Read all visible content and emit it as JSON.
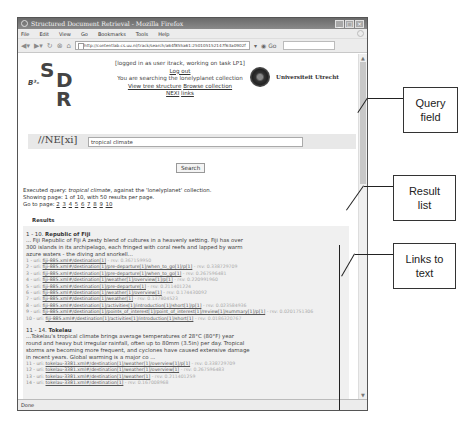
{
  "browser": {
    "window_title": "Structured Document Retrieval - Mozilla Firefox",
    "menu": [
      "File",
      "Edit",
      "View",
      "Go",
      "Bookmarks",
      "Tools",
      "Help"
    ],
    "url": "http://contentlab.cs.uu.nl/track/search/a64f855a61:250105152147f63a0902f",
    "status": "Done"
  },
  "logo": {
    "s": "S",
    "d": "D",
    "r": "R",
    "b": "B³-",
    "nexi": "//NE[xi]"
  },
  "session": {
    "logged_in": "[logged in as user itrack, working on task LP1]",
    "logout": "Log out",
    "collection_note": "You are searching the lonelyplanet collection",
    "view_tree": "View tree structure",
    "browse": "Browse collection",
    "nexi": "NEXI",
    "links": "links"
  },
  "university": {
    "name": "Universiteit Utrecht"
  },
  "search": {
    "query": "tropical climate",
    "button": "Search"
  },
  "exec": {
    "prefix": "Executed query: ",
    "query": "tropical climate",
    "suffix": ", against the 'lonelyplanet' collection.",
    "showing": "Showing page: 1 of 10, with 50 results per page.",
    "goto": "Go to page:",
    "pages": [
      "2",
      "3",
      "4",
      "5",
      "6",
      "7",
      "8",
      "9",
      "10"
    ]
  },
  "results": {
    "heading": "Results",
    "groups": [
      {
        "range": "1 - 10.",
        "title": "Republic of Fiji",
        "snippet": "... Fiji Republic of Fiji A zesty blend of cultures in a heavenly setting. Fiji has over 300 islands in its archipelago, each fringed with coral reefs and lapped by warm azure waters - the diving and snorkell...",
        "links": [
          {
            "n": "1 - uri:",
            "path": "fiji-885.xml#/destination[1]",
            "rsv": "- rsv: 0.367159950"
          },
          {
            "n": "2 - uri:",
            "path": "fiji-885.xml#/destination[1]/pre-departure[1]/when_to_go[1]/p[1]",
            "rsv": "- rsv: 0.338729709"
          },
          {
            "n": "3 - uri:",
            "path": "fiji-885.xml#/destination[1]/pre-departure[1]/when_to_go[1]",
            "rsv": "- rsv: 0.267596481"
          },
          {
            "n": "4 - uri:",
            "path": "fiji-885.xml#/destination[1]/weather[1]/overview[1]/p[1]",
            "rsv": "- rsv: 0.220991960"
          },
          {
            "n": "5 - uri:",
            "path": "fiji-885.xml#/destination[1]/pre-departure[1]",
            "rsv": "- rsv: 0.211401224"
          },
          {
            "n": "6 - uri:",
            "path": "fiji-885.xml#/destination[1]/weather[1]/overview[1]",
            "rsv": "- rsv: 0.174430092"
          },
          {
            "n": "7 - uri:",
            "path": "fiji-885.xml#/destination[1]/weather[1]",
            "rsv": "- rsv: 0.137804523"
          },
          {
            "n": "8 - uri:",
            "path": "fiji-885.xml#/destination[1]/activities[1]/introduction[1]/short[1]/p[1]",
            "rsv": "- rsv: 0.023584936"
          },
          {
            "n": "9 - uri:",
            "path": "fiji-885.xml#/destination[1]/points_of_interest[1]/point_of_interest[1]/review[1]/summary[1]/p[1]",
            "rsv": "- rsv: 0.0201751306"
          },
          {
            "n": "10 - uri:",
            "path": "fiji-885.xml#/destination[1]/activities[1]/introduction[1]/short[1]",
            "rsv": "- rsv: 0.0186320767"
          }
        ]
      },
      {
        "range": "11 - 14.",
        "title": "Tokelau",
        "snippet": "...Tokelau's tropical climate brings average temperatures of 28°C (80°F) year round and heavy but irregular rainfall, often up to 80mm (3.5in) per day. Tropical storms are becoming more frequent, and cyclones have caused extensive damage in recent years. Global warming is a major co ...",
        "links": [
          {
            "n": "11 - uri:",
            "path": "tokelau-3381.xml#/destination[1]/weather[1]/overview[1]/p[1]",
            "rsv": "- rsv: 0.338729709"
          },
          {
            "n": "12 - uri:",
            "path": "tokelau-3381.xml#/destination[1]/weather[1]/overview[1]",
            "rsv": "- rsv: 0.267596483"
          },
          {
            "n": "13 - uri:",
            "path": "tokelau-3381.xml#/destination[1]/weather[1]",
            "rsv": "- rsv: 0.211401259"
          },
          {
            "n": "14 - uri:",
            "path": "tokelau-3381.xml#/destination[1]",
            "rsv": "- rsv: 0.167008968"
          }
        ]
      }
    ]
  },
  "callouts": {
    "query_field": "Query field",
    "result_list": "Result list",
    "links_to_text": "Links to text"
  }
}
